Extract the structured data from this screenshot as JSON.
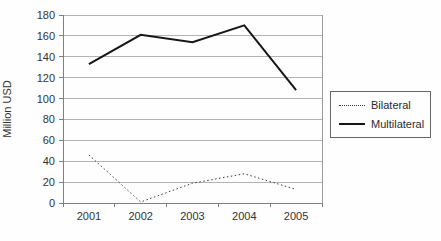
{
  "chart_data": {
    "type": "line",
    "title": "",
    "xlabel": "",
    "ylabel": "Million USD",
    "categories": [
      "2001",
      "2002",
      "2003",
      "2004",
      "2005"
    ],
    "series": [
      {
        "name": "Bilateral",
        "line_style": "dotted",
        "color": "#3a3a3a",
        "width": 1,
        "values": [
          46,
          1,
          19,
          28,
          13
        ]
      },
      {
        "name": "Multilateral",
        "line_style": "solid",
        "color": "#161616",
        "width": 2,
        "values": [
          133,
          161,
          154,
          170,
          108
        ]
      }
    ],
    "ylim": [
      0,
      180
    ],
    "ytick_step": 20,
    "yticks": [
      0,
      20,
      40,
      60,
      80,
      100,
      120,
      140,
      160,
      180
    ],
    "grid": "horizontal",
    "gridline_color": "#b3b3b3",
    "axis_color": "#808080",
    "tick_label_color": "#333333",
    "legend_position": "right"
  }
}
